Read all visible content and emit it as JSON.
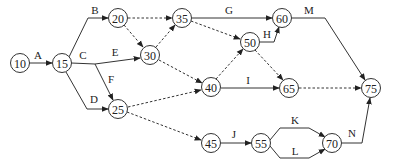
{
  "diagram": {
    "type": "activity-on-arrow network",
    "nodes": [
      {
        "id": "10",
        "label": "10",
        "x": 20,
        "y": 63
      },
      {
        "id": "15",
        "label": "15",
        "x": 62,
        "y": 63
      },
      {
        "id": "20",
        "label": "20",
        "x": 118,
        "y": 18
      },
      {
        "id": "30",
        "label": "30",
        "x": 150,
        "y": 55
      },
      {
        "id": "25",
        "label": "25",
        "x": 118,
        "y": 109
      },
      {
        "id": "35",
        "label": "35",
        "x": 182,
        "y": 18
      },
      {
        "id": "40",
        "label": "40",
        "x": 211,
        "y": 87
      },
      {
        "id": "50",
        "label": "50",
        "x": 250,
        "y": 42
      },
      {
        "id": "60",
        "label": "60",
        "x": 282,
        "y": 18
      },
      {
        "id": "65",
        "label": "65",
        "x": 289,
        "y": 88
      },
      {
        "id": "75",
        "label": "75",
        "x": 371,
        "y": 88
      },
      {
        "id": "45",
        "label": "45",
        "x": 211,
        "y": 143
      },
      {
        "id": "55",
        "label": "55",
        "x": 261,
        "y": 143
      },
      {
        "id": "70",
        "label": "70",
        "x": 332,
        "y": 143
      }
    ],
    "edges": [
      {
        "from": "10",
        "to": "15",
        "label": "A",
        "style": "solid"
      },
      {
        "from": "15",
        "to": "20",
        "label": "B",
        "style": "solid"
      },
      {
        "from": "15",
        "to": "30",
        "label": "C / E",
        "style": "solid"
      },
      {
        "from": "15",
        "to": "25",
        "label": "D",
        "style": "solid"
      },
      {
        "from": "15",
        "to": "25",
        "label": "F",
        "style": "solid"
      },
      {
        "from": "20",
        "to": "35",
        "label": "",
        "style": "dashed"
      },
      {
        "from": "20",
        "to": "30",
        "label": "",
        "style": "dashed"
      },
      {
        "from": "30",
        "to": "35",
        "label": "",
        "style": "dashed"
      },
      {
        "from": "30",
        "to": "40",
        "label": "",
        "style": "dashed"
      },
      {
        "from": "25",
        "to": "40",
        "label": "",
        "style": "dashed"
      },
      {
        "from": "25",
        "to": "45",
        "label": "",
        "style": "dashed"
      },
      {
        "from": "35",
        "to": "60",
        "label": "G",
        "style": "solid"
      },
      {
        "from": "35",
        "to": "50",
        "label": "",
        "style": "dashed"
      },
      {
        "from": "40",
        "to": "50",
        "label": "",
        "style": "dashed"
      },
      {
        "from": "50",
        "to": "60",
        "label": "H",
        "style": "solid"
      },
      {
        "from": "50",
        "to": "65",
        "label": "",
        "style": "dashed"
      },
      {
        "from": "40",
        "to": "65",
        "label": "I",
        "style": "solid"
      },
      {
        "from": "60",
        "to": "75",
        "label": "M",
        "style": "solid"
      },
      {
        "from": "65",
        "to": "75",
        "label": "",
        "style": "dashed"
      },
      {
        "from": "45",
        "to": "55",
        "label": "J",
        "style": "solid"
      },
      {
        "from": "55",
        "to": "70",
        "label": "K",
        "style": "solid"
      },
      {
        "from": "55",
        "to": "70",
        "label": "L",
        "style": "solid"
      },
      {
        "from": "70",
        "to": "75",
        "label": "N",
        "style": "solid"
      }
    ],
    "activity_labels": {
      "A": "A",
      "B": "B",
      "C": "C",
      "D": "D",
      "E": "E",
      "F": "F",
      "G": "G",
      "H": "H",
      "I": "I",
      "J": "J",
      "K": "K",
      "L": "L",
      "M": "M",
      "N": "N"
    },
    "colors": {
      "stroke": "#333333",
      "text": "#222222",
      "background": "#ffffff"
    }
  }
}
